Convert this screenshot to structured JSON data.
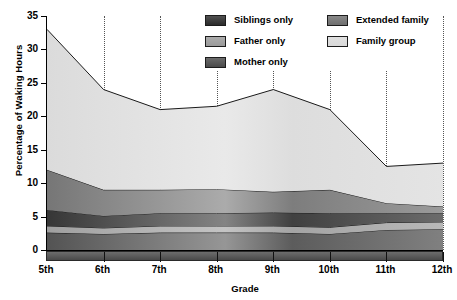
{
  "chart_data": {
    "type": "area",
    "title": "",
    "xlabel": "Grade",
    "ylabel": "Percentage of Waking Hours",
    "categories": [
      "5th",
      "6th",
      "7th",
      "8th",
      "9th",
      "10th",
      "11th",
      "12th"
    ],
    "ylim": [
      0,
      35
    ],
    "yticks": [
      0,
      5,
      10,
      15,
      20,
      25,
      30,
      35
    ],
    "grid": "vertical-dotted",
    "stacked": true,
    "stack_order_bottom_to_top": [
      "Mother only",
      "Father only",
      "Siblings only",
      "Extended family",
      "Family group"
    ],
    "legend_position": "top-right-inside",
    "series": [
      {
        "name": "Mother only",
        "color": "#4a4a4a",
        "values": [
          2.6,
          2.4,
          2.6,
          2.6,
          2.6,
          2.4,
          3.0,
          3.1
        ]
      },
      {
        "name": "Father only",
        "color": "#9a9a9a",
        "values": [
          1.0,
          0.9,
          1.0,
          1.0,
          1.0,
          1.0,
          1.1,
          1.1
        ]
      },
      {
        "name": "Siblings only",
        "color": "#2b2b2b",
        "values": [
          2.4,
          1.8,
          1.9,
          1.9,
          2.0,
          2.1,
          1.4,
          1.3
        ]
      },
      {
        "name": "Extended family",
        "color": "#6f6f6f",
        "values": [
          6.0,
          3.9,
          3.5,
          3.6,
          3.1,
          3.5,
          1.5,
          1.0
        ]
      },
      {
        "name": "Family group",
        "color": "#d9d9d9",
        "values": [
          21.0,
          15.0,
          12.0,
          12.4,
          15.3,
          12.0,
          5.5,
          6.5
        ]
      }
    ],
    "cumulative_totals": [
      33.0,
      24.0,
      21.0,
      21.5,
      24.0,
      21.0,
      12.5,
      13.0
    ],
    "boundaries_bottom_to_top": {
      "mother_top": [
        2.6,
        2.4,
        2.6,
        2.6,
        2.6,
        2.4,
        3.0,
        3.1
      ],
      "father_top": [
        3.6,
        3.3,
        3.6,
        3.6,
        3.6,
        3.4,
        4.1,
        4.2
      ],
      "siblings_top": [
        6.0,
        5.1,
        5.5,
        5.5,
        5.6,
        5.5,
        5.5,
        5.5
      ],
      "extended_top": [
        12.0,
        9.0,
        9.0,
        9.1,
        8.7,
        9.0,
        7.0,
        6.5
      ],
      "family_top": [
        33.0,
        24.0,
        21.0,
        21.5,
        24.0,
        21.0,
        12.5,
        13.0
      ]
    },
    "legend_entries": [
      {
        "label": "Siblings only",
        "color": "#2b2b2b"
      },
      {
        "label": "Father only",
        "color": "#9a9a9a"
      },
      {
        "label": "Mother only",
        "color": "#4a4a4a"
      },
      {
        "label": "Extended family",
        "color": "#6f6f6f"
      },
      {
        "label": "Family group",
        "color": "#d9d9d9"
      }
    ]
  }
}
